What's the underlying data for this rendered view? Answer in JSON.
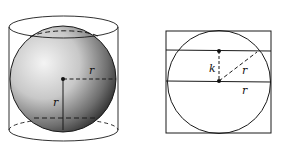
{
  "figures": [
    {
      "id": "sphere-in-cylinder",
      "description": "Sphere inscribed in a cylinder",
      "labels": {
        "horizontal_radius": "r",
        "vertical_radius": "r"
      }
    },
    {
      "id": "cross-section",
      "description": "Cross-section: circle inscribed in a square with a chord at distance k from center",
      "labels": {
        "distance": "k",
        "slant_radius": "r",
        "horizontal_radius": "r"
      }
    }
  ],
  "colors": {
    "stroke": "#1a1a1a",
    "background": "#ffffff"
  }
}
